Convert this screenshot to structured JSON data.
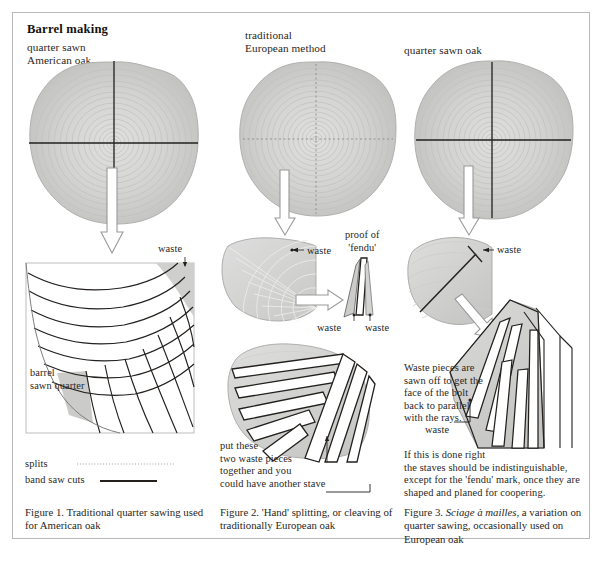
{
  "title": "Barrel making",
  "colors": {
    "frame_border": "#b9b9bd",
    "page_bg": "#ffffff",
    "wood_light": "#d8d8d6",
    "wood_mid": "#c6c6c4",
    "wood_dark": "#b3b3b1",
    "ring_line": "#bdbdbb",
    "ink": "#23201e",
    "stave_fill": "#ffffff",
    "waste_fill": "#c9c9c7",
    "arrow_outline": "#9a9a9a"
  },
  "columns": [
    {
      "id": "col1",
      "log_label": "quarter sawn\nAmerican oak",
      "log_cross": "solid",
      "quarter_labels": {
        "waste": "waste",
        "barrel": "barrel\nsawn quarter"
      },
      "caption": "Figure 1.  Traditional quarter sawing used for American oak"
    },
    {
      "id": "col2",
      "log_label": "traditional\nEuropean method",
      "log_cross": "dotted",
      "quarter_labels": {
        "waste": "waste",
        "proof": "proof of\n'fendu'",
        "waste_left": "waste",
        "waste_right": "waste",
        "note": "put these\ntwo waste pieces\ntogether and you\ncould have another stave"
      },
      "caption": "Figure 2.  'Hand' splitting, or cleaving of traditionally European oak"
    },
    {
      "id": "col3",
      "log_label": "quarter sawn oak",
      "log_cross": "solid",
      "quarter_labels": {
        "waste_top": "waste",
        "note": "Waste pieces are\nsawn off to get the\nface of the bolt\nback to parallel\nwith the rays.",
        "waste_bottom": "waste",
        "note2": "If this is done right\nthe staves should be indistinguishable,\nexcept for the 'fendu' mark, once they are\nshaped and planed for coopering."
      },
      "caption_prefix": "Figure 3.  ",
      "caption_italic": "Sciage à mailles",
      "caption_rest": ", a variation on quarter sawing, occasionally used on European oak"
    }
  ],
  "legend": {
    "items": [
      {
        "label": "splits",
        "style": "dotted"
      },
      {
        "label": "band saw cuts",
        "style": "solid"
      }
    ]
  }
}
